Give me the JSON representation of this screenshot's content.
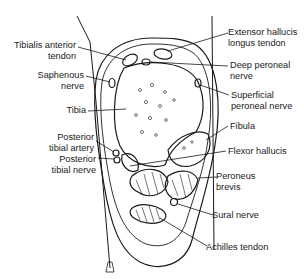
{
  "diagram": {
    "labels": {
      "tibialis_anterior": [
        "Tibialis anterior",
        "tendon"
      ],
      "saphenous": [
        "Saphenous",
        "nerve"
      ],
      "tibia": "Tibia",
      "posterior_tibial_artery": [
        "Posterior",
        "tibial artery"
      ],
      "posterior_tibial_nerve": [
        "Posterior",
        "tibial nerve"
      ],
      "extensor_hallucis": [
        "Extensor hallucis",
        "longus tendon"
      ],
      "deep_peroneal": [
        "Deep peroneal",
        "nerve"
      ],
      "superficial_peroneal": [
        "Superficial",
        "peroneal nerve"
      ],
      "fibula": "Fibula",
      "flexor_hallucis": "Flexor hallucis",
      "peroneus_brevis": [
        "Peroneus",
        "brevis"
      ],
      "sural_nerve": "Sural nerve",
      "achilles": "Achilles tendon"
    },
    "colors": {
      "line": "#1a1a1a",
      "background": "#ffffff"
    }
  }
}
